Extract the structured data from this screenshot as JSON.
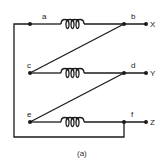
{
  "diagram": {
    "caption": "(a)",
    "nodes": {
      "a": {
        "label": "a"
      },
      "b": {
        "label": "b"
      },
      "c": {
        "label": "c"
      },
      "d": {
        "label": "d"
      },
      "e": {
        "label": "e"
      },
      "f": {
        "label": "f"
      }
    },
    "terminals": {
      "X": {
        "label": "X"
      },
      "Y": {
        "label": "Y"
      },
      "Z": {
        "label": "Z"
      }
    },
    "windings": [
      {
        "from": "a",
        "to": "b"
      },
      {
        "from": "c",
        "to": "d"
      },
      {
        "from": "e",
        "to": "f"
      }
    ],
    "connections": [
      {
        "from": "c",
        "to": "b"
      },
      {
        "from": "e",
        "to": "d"
      },
      {
        "from": "a",
        "to": "f"
      }
    ],
    "colors": {
      "line": "#1a1a1a",
      "background": "#ffffff"
    }
  }
}
